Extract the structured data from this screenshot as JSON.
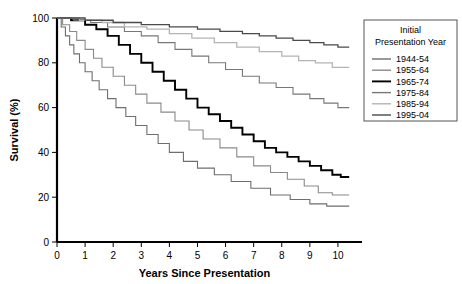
{
  "chart_data": {
    "type": "line",
    "title": "",
    "xlabel": "Years Since Presentation",
    "ylabel": "Survival (%)",
    "xlim": [
      0,
      10.5
    ],
    "ylim": [
      0,
      100
    ],
    "xticks": [
      "0",
      "1",
      "2",
      "3",
      "4",
      "5",
      "6",
      "7",
      "8",
      "9",
      "10"
    ],
    "yticks": [
      "0",
      "20",
      "40",
      "60",
      "80",
      "100"
    ],
    "grid": false,
    "legend_position": "right",
    "legend_title": "Initial Presentation Year",
    "series": [
      {
        "name": "1944-54",
        "color": "#6e6e6e",
        "width": 1.1,
        "final_value": 16,
        "points": [
          [
            0,
            100
          ],
          [
            0.15,
            96
          ],
          [
            0.3,
            92
          ],
          [
            0.45,
            88
          ],
          [
            0.6,
            84
          ],
          [
            0.8,
            80
          ],
          [
            1.0,
            76
          ],
          [
            1.25,
            72
          ],
          [
            1.5,
            68
          ],
          [
            1.8,
            64
          ],
          [
            2.1,
            60
          ],
          [
            2.45,
            56
          ],
          [
            2.8,
            52
          ],
          [
            3.2,
            48
          ],
          [
            3.6,
            44
          ],
          [
            4.0,
            40
          ],
          [
            4.5,
            36
          ],
          [
            5.0,
            33
          ],
          [
            5.6,
            30
          ],
          [
            6.2,
            27
          ],
          [
            6.9,
            24
          ],
          [
            7.6,
            21
          ],
          [
            8.3,
            19
          ],
          [
            9.0,
            17
          ],
          [
            9.6,
            16
          ],
          [
            10.4,
            16
          ]
        ]
      },
      {
        "name": "1955-64",
        "color": "#8a8a8a",
        "width": 1.1,
        "final_value": 21,
        "points": [
          [
            0,
            100
          ],
          [
            0.2,
            97
          ],
          [
            0.45,
            94
          ],
          [
            0.7,
            90
          ],
          [
            1.0,
            86
          ],
          [
            1.3,
            82
          ],
          [
            1.6,
            78
          ],
          [
            2.0,
            74
          ],
          [
            2.4,
            70
          ],
          [
            2.8,
            66
          ],
          [
            3.2,
            62
          ],
          [
            3.7,
            58
          ],
          [
            4.2,
            54
          ],
          [
            4.7,
            50
          ],
          [
            5.2,
            46
          ],
          [
            5.8,
            42
          ],
          [
            6.4,
            38
          ],
          [
            7.0,
            34
          ],
          [
            7.6,
            31
          ],
          [
            8.2,
            28
          ],
          [
            8.8,
            25
          ],
          [
            9.3,
            22
          ],
          [
            9.8,
            21
          ],
          [
            10.4,
            21
          ]
        ]
      },
      {
        "name": "1965-74",
        "color": "#000000",
        "width": 1.9,
        "final_value": 29,
        "points": [
          [
            0,
            100
          ],
          [
            0.5,
            99
          ],
          [
            1.0,
            97
          ],
          [
            1.4,
            95
          ],
          [
            1.8,
            92
          ],
          [
            2.2,
            88
          ],
          [
            2.6,
            84
          ],
          [
            3.0,
            80
          ],
          [
            3.4,
            76
          ],
          [
            3.8,
            72
          ],
          [
            4.2,
            68
          ],
          [
            4.6,
            64
          ],
          [
            5.0,
            60
          ],
          [
            5.4,
            57
          ],
          [
            5.8,
            54
          ],
          [
            6.2,
            51
          ],
          [
            6.6,
            48
          ],
          [
            7.0,
            45
          ],
          [
            7.4,
            42
          ],
          [
            7.8,
            40
          ],
          [
            8.2,
            38
          ],
          [
            8.6,
            36
          ],
          [
            9.0,
            34
          ],
          [
            9.4,
            32
          ],
          [
            9.8,
            30
          ],
          [
            10.1,
            29
          ],
          [
            10.4,
            29
          ]
        ]
      },
      {
        "name": "1975-84",
        "color": "#777777",
        "width": 1.1,
        "final_value": 60,
        "points": [
          [
            0,
            100
          ],
          [
            0.6,
            99
          ],
          [
            1.2,
            98
          ],
          [
            1.8,
            96
          ],
          [
            2.4,
            94
          ],
          [
            3.0,
            92
          ],
          [
            3.6,
            89
          ],
          [
            4.2,
            86
          ],
          [
            4.8,
            83
          ],
          [
            5.4,
            80
          ],
          [
            6.0,
            77
          ],
          [
            6.6,
            74
          ],
          [
            7.2,
            71
          ],
          [
            7.8,
            69
          ],
          [
            8.4,
            66
          ],
          [
            9.0,
            64
          ],
          [
            9.5,
            62
          ],
          [
            10.0,
            60
          ],
          [
            10.4,
            60
          ]
        ]
      },
      {
        "name": "1985-94",
        "color": "#b4b4b4",
        "width": 1.3,
        "final_value": 78,
        "points": [
          [
            0,
            100
          ],
          [
            0.8,
            99
          ],
          [
            1.6,
            98
          ],
          [
            2.4,
            96
          ],
          [
            3.2,
            95
          ],
          [
            4.0,
            93
          ],
          [
            4.8,
            91
          ],
          [
            5.6,
            89
          ],
          [
            6.4,
            87
          ],
          [
            7.2,
            85
          ],
          [
            8.0,
            83
          ],
          [
            8.6,
            81
          ],
          [
            9.2,
            80
          ],
          [
            9.8,
            78
          ],
          [
            10.4,
            78
          ]
        ]
      },
      {
        "name": "1995-04",
        "color": "#4a4a4a",
        "width": 1.3,
        "final_value": 87,
        "points": [
          [
            0,
            100
          ],
          [
            1.0,
            99
          ],
          [
            2.0,
            98
          ],
          [
            3.0,
            97
          ],
          [
            4.0,
            96
          ],
          [
            5.0,
            95
          ],
          [
            5.8,
            94
          ],
          [
            6.6,
            93
          ],
          [
            7.2,
            92
          ],
          [
            7.8,
            91
          ],
          [
            8.4,
            90
          ],
          [
            9.0,
            89
          ],
          [
            9.5,
            88
          ],
          [
            10.0,
            87
          ],
          [
            10.4,
            87
          ]
        ]
      }
    ]
  }
}
